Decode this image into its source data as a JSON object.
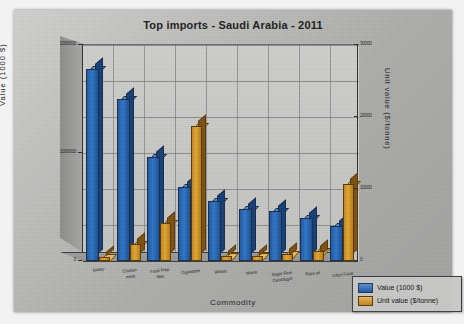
{
  "chart_data": {
    "type": "bar",
    "title": "Top imports - Saudi Arabia - 2011",
    "xlabel": "Commodity",
    "ylabel": "Value (1000 $)",
    "y2label": "Unit value ($/tonne)",
    "categories": [
      "Barley",
      "Chicken meat",
      "Food Prep Nes",
      "Cigarettes",
      "Wheat",
      "Maize",
      "Sugar Raw Centrifugal",
      "Palm oil",
      "Infant Food"
    ],
    "grid": true,
    "legend_position": "bottom-right",
    "ylim": [
      0,
      2200000
    ],
    "y2lim": [
      0,
      32000
    ],
    "yticks": [
      "0",
      "1000000",
      "2000000"
    ],
    "y2ticks": [
      "0",
      "10000",
      "20000",
      "30000"
    ],
    "series": [
      {
        "name": "Value (1000 $)",
        "axis": "left",
        "color": "#1d5aa8",
        "values": [
          2010000,
          1690000,
          1075000,
          760000,
          610000,
          530000,
          505000,
          430000,
          345000
        ]
      },
      {
        "name": "Unit value ($/tonne)",
        "axis": "right",
        "color": "#c5861c",
        "values": [
          310,
          2250,
          5550,
          20500,
          490,
          480,
          720,
          1250,
          11600
        ]
      }
    ]
  },
  "axes": {
    "left_title": "Value (1000 $)",
    "right_title": "Unit value ($/tonne)",
    "bottom_title": "Commodity",
    "left_ticks": [
      "2000000",
      "1000000",
      "0"
    ],
    "right_ticks": [
      "30000",
      "20000",
      "10000",
      "0"
    ]
  },
  "legend": {
    "items": [
      {
        "label": "Value (1000 $)",
        "color": "#1d5aa8"
      },
      {
        "label": "Unit value ($/tonne)",
        "color": "#c5861c"
      }
    ]
  },
  "categories_display": [
    "Barley",
    "Chicken\nmeat",
    "Food Prep\nNes",
    "Cigarettes",
    "Wheat",
    "Maize",
    "Sugar Raw\nCentrifugal",
    "Palm oil",
    "Infant Food"
  ]
}
